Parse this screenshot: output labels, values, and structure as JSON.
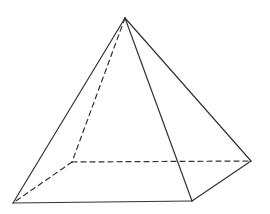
{
  "diagram": {
    "type": "square-pyramid",
    "width": 270,
    "height": 214,
    "background": "#ffffff",
    "stroke_color": "#333333",
    "stroke_width": 1.2,
    "dash_pattern": "5,4",
    "vertices": {
      "apex": [
        125,
        18
      ],
      "front_left": [
        13,
        203
      ],
      "front_right": [
        192,
        201
      ],
      "back_right": [
        251,
        161
      ],
      "back_left": [
        72,
        162
      ]
    },
    "visible_edges": [
      [
        "apex",
        "front_left"
      ],
      [
        "apex",
        "front_right"
      ],
      [
        "apex",
        "back_right"
      ],
      [
        "front_left",
        "front_right"
      ],
      [
        "front_right",
        "back_right"
      ]
    ],
    "hidden_edges": [
      [
        "apex",
        "back_left"
      ],
      [
        "back_left",
        "front_left"
      ],
      [
        "back_left",
        "back_right"
      ]
    ]
  }
}
